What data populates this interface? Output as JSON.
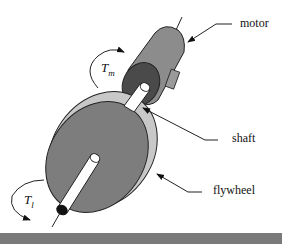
{
  "diagram": {
    "labels": {
      "motor": "motor",
      "shaft": "shaft",
      "flywheel": "flywheel"
    },
    "symbols": {
      "motor_torque": {
        "base": "T",
        "sub": "m"
      },
      "load_torque": {
        "base": "T",
        "sub": "l"
      }
    },
    "colors": {
      "motor_body": "#8c8c8c",
      "motor_face": "#4a4a4a",
      "flywheel_face": "#7d7d7d",
      "flywheel_rim": "#c8c8c8",
      "shaft": "#ffffff",
      "bottom_bar": "#7a7a7a"
    }
  }
}
